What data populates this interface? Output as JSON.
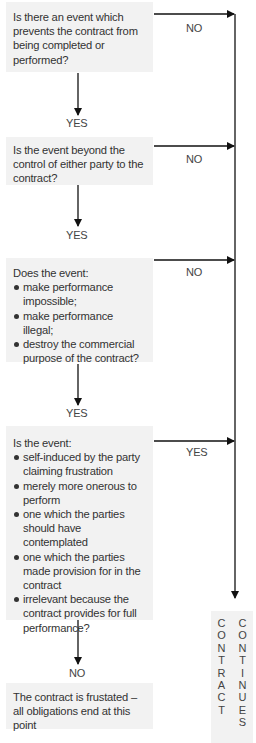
{
  "flowchart": {
    "q1": {
      "text": "Is there an event which prevents the contract from being completed or performed?"
    },
    "q1_no": "NO",
    "q1_yes": "YES",
    "q2": {
      "text": "Is the event beyond the control of either party to the contract?"
    },
    "q2_no": "NO",
    "q2_yes": "YES",
    "q3": {
      "intro": "Does the event:",
      "bullets": [
        "make performance impossible;",
        "make performance illegal;",
        "destroy the commercial purpose of the contract?"
      ]
    },
    "q3_no": "NO",
    "q3_yes": "YES",
    "q4": {
      "intro": "Is the event:",
      "bullets": [
        "self-induced by the party claiming frustration",
        "merely more onerous to perform",
        "one which the parties should have contemplated",
        "one which the parties made provision for in the contract",
        "irrelevant because the contract provides for full performance?"
      ]
    },
    "q4_yes": "YES",
    "q4_no": "NO",
    "outcome_frustrated": "The contract is frustated – all obligations end at this point",
    "outcome_continues": {
      "word1": [
        "C",
        "O",
        "N",
        "T",
        "R",
        "A",
        "C",
        "T"
      ],
      "word2": [
        "C",
        "O",
        "N",
        "T",
        "I",
        "N",
        "U",
        "E",
        "S"
      ]
    }
  }
}
